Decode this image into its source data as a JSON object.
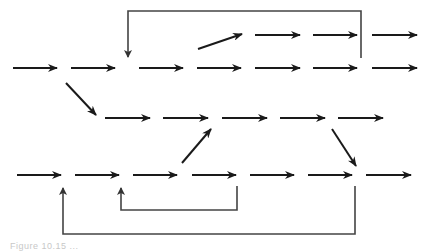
{
  "diagram": {
    "type": "activity-flow-diagram",
    "stroke_color": "#1a1a1a",
    "loop_color": "#444444",
    "rows": [
      {
        "id": "row-a",
        "y": 35,
        "arrows": [
          [
            255,
            300
          ],
          [
            313,
            357
          ],
          [
            372,
            417
          ]
        ]
      },
      {
        "id": "row-b",
        "y": 68,
        "arrows": [
          [
            13,
            57
          ],
          [
            71,
            115
          ],
          [
            139,
            183
          ],
          [
            197,
            241
          ],
          [
            255,
            300
          ],
          [
            313,
            357
          ],
          [
            372,
            417
          ]
        ]
      },
      {
        "id": "row-c",
        "y": 118,
        "arrows": [
          [
            105,
            150
          ],
          [
            163,
            208
          ],
          [
            222,
            267
          ],
          [
            280,
            325
          ],
          [
            338,
            383
          ]
        ]
      },
      {
        "id": "row-d",
        "y": 175,
        "arrows": [
          [
            17,
            61
          ],
          [
            75,
            119
          ],
          [
            133,
            177
          ],
          [
            192,
            236
          ],
          [
            250,
            294
          ],
          [
            308,
            352
          ],
          [
            366,
            411
          ]
        ]
      }
    ],
    "diagonals": [
      {
        "id": "b-to-a",
        "from": [
          198,
          49
        ],
        "to": [
          242,
          34
        ]
      },
      {
        "id": "b-to-c",
        "from": [
          66,
          83
        ],
        "to": [
          96,
          115
        ]
      },
      {
        "id": "d-to-c",
        "from": [
          182,
          163
        ],
        "to": [
          211,
          129
        ]
      },
      {
        "id": "c-to-d",
        "from": [
          332,
          129
        ],
        "to": [
          356,
          166
        ]
      }
    ],
    "loops": [
      {
        "id": "top-loop",
        "points": [
          [
            361,
            58
          ],
          [
            361,
            11
          ],
          [
            128,
            11
          ],
          [
            128,
            57
          ]
        ]
      },
      {
        "id": "inner-bottom-loop",
        "points": [
          [
            237,
            186
          ],
          [
            237,
            210
          ],
          [
            121,
            210
          ],
          [
            121,
            188
          ]
        ]
      },
      {
        "id": "outer-bottom-loop",
        "points": [
          [
            355,
            186
          ],
          [
            355,
            234
          ],
          [
            63,
            234
          ],
          [
            63,
            188
          ]
        ]
      }
    ]
  },
  "caption": {
    "text": "Figure 10.15 ..."
  }
}
